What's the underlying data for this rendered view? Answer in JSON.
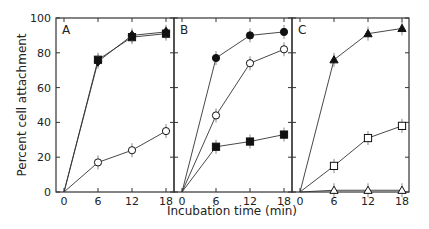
{
  "chart_data": {
    "type": "line",
    "title": "",
    "xlabel": "Incubation time (min)",
    "ylabel": "Percent cell attachment",
    "ylim": [
      0,
      100
    ],
    "yticks": [
      0,
      20,
      40,
      60,
      80,
      100
    ],
    "xticks": [
      0,
      6,
      12,
      18
    ],
    "grid": false,
    "legend": "none",
    "panels": [
      {
        "label": "A",
        "x": [
          0,
          6,
          12,
          18
        ],
        "series": [
          {
            "name": "filled squares",
            "marker": "square",
            "filled": true,
            "values": [
              0,
              76,
              89,
              91
            ]
          },
          {
            "name": "filled diamonds",
            "marker": "diamond",
            "filled": true,
            "values": [
              0,
              75,
              90,
              92
            ]
          },
          {
            "name": "open circles",
            "marker": "circle",
            "filled": false,
            "values": [
              0,
              17,
              24,
              35
            ]
          }
        ]
      },
      {
        "label": "B",
        "x": [
          0,
          6,
          12,
          18
        ],
        "series": [
          {
            "name": "filled circles",
            "marker": "circle",
            "filled": true,
            "values": [
              0,
              77,
              90,
              92
            ]
          },
          {
            "name": "open circles",
            "marker": "circle",
            "filled": false,
            "values": [
              0,
              44,
              74,
              82
            ]
          },
          {
            "name": "filled squares",
            "marker": "square",
            "filled": true,
            "values": [
              0,
              26,
              29,
              33
            ]
          }
        ]
      },
      {
        "label": "C",
        "x": [
          0,
          6,
          12,
          18
        ],
        "series": [
          {
            "name": "filled triangles",
            "marker": "triangle",
            "filled": true,
            "values": [
              0,
              76,
              91,
              94
            ]
          },
          {
            "name": "open squares",
            "marker": "square",
            "filled": false,
            "values": [
              0,
              15,
              31,
              38
            ]
          },
          {
            "name": "open triangles",
            "marker": "triangle",
            "filled": false,
            "values": [
              0,
              1,
              1,
              1
            ]
          }
        ]
      }
    ]
  }
}
